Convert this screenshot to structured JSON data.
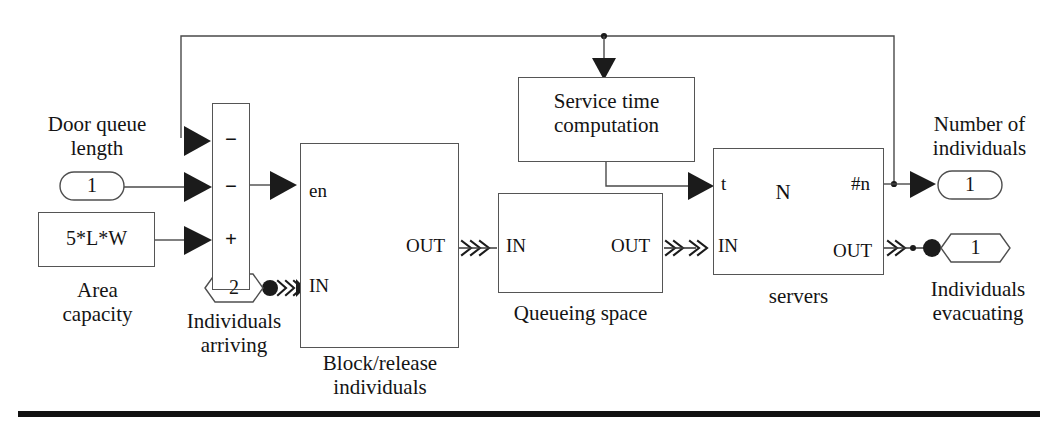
{
  "diagram": {
    "type": "simulink-block-diagram",
    "background": "#ffffff",
    "line_color": "#4a4a4a"
  },
  "sources": {
    "door_queue_label": "Door queue\nlength",
    "door_queue_value": "1",
    "area_capacity_label": "Area\ncapacity",
    "area_capacity_value": "5*L*W"
  },
  "sum_block": {
    "signs": [
      "−",
      "−",
      "+"
    ]
  },
  "individuals_arriving": {
    "label": "Individuals\narriving",
    "value": "2"
  },
  "block_release": {
    "label": "Block/release\nindividuals",
    "ports": {
      "enable": "en",
      "in": "IN",
      "out": "OUT"
    },
    "icon": "gate-pulse-icon"
  },
  "queueing_space": {
    "label": "Queueing space",
    "ports": {
      "in": "IN",
      "out": "OUT"
    },
    "icon": "queue-stack-icon"
  },
  "servers": {
    "label": "servers",
    "ports": {
      "t": "t",
      "in": "IN",
      "n": "#n",
      "out": "OUT"
    },
    "icon_label": "N",
    "icon": "server-circle-icon"
  },
  "service_time": {
    "label": "Service time\ncomputation"
  },
  "outputs": {
    "number_of_individuals_label": "Number of\nindividuals",
    "number_of_individuals_value": "1",
    "individuals_evacuating_label": "Individuals\nevacuating",
    "individuals_evacuating_value": "1"
  }
}
